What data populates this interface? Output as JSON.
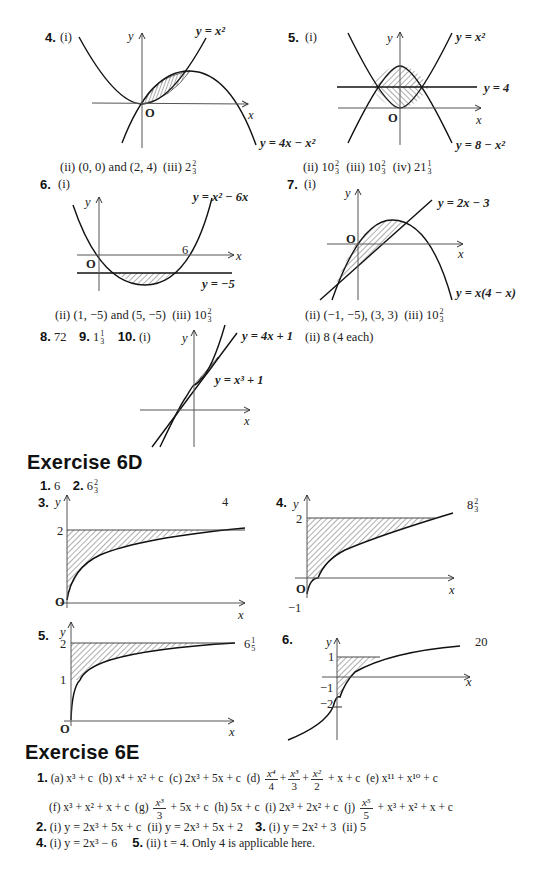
{
  "q4": {
    "num": "4.",
    "part_i": "(i)",
    "label_y": "y",
    "label_x": "x",
    "label_o": "O",
    "curve1": "y = x²",
    "curve2": "y = 4x − x²",
    "answer_ii": "(ii) (0, 0) and (2, 4)",
    "answer_iii_prefix": "(iii) 2",
    "answer_iii_num": "2",
    "answer_iii_den": "3"
  },
  "q5": {
    "num": "5.",
    "part_i": "(i)",
    "label_y": "y",
    "label_x": "x",
    "label_o": "O",
    "curve1": "y = x²",
    "line": "y = 4",
    "curve2": "y = 8 − x²",
    "answer_ii": "(ii) 10",
    "answer_ii_num": "2",
    "answer_ii_den": "3",
    "answer_iii": "(iii) 10",
    "answer_iii_num": "2",
    "answer_iii_den": "3",
    "answer_iv": "(iv) 21",
    "answer_iv_num": "1",
    "answer_iv_den": "3"
  },
  "q6": {
    "num": "6.",
    "part_i": "(i)",
    "label_y": "y",
    "label_x": "x",
    "label_o": "O",
    "label_6": "6",
    "curve": "y = x² − 6x",
    "line": "y = −5",
    "answer_ii": "(ii) (1, −5) and (5, −5)",
    "answer_iii": "(iii) 10",
    "answer_iii_num": "2",
    "answer_iii_den": "3"
  },
  "q7": {
    "num": "7.",
    "part_i": "(i)",
    "label_y": "y",
    "label_x": "x",
    "label_o": "O",
    "line": "y = 2x − 3",
    "curve": "y = x(4 − x)",
    "answer_ii": "(ii) (−1, −5), (3, 3)",
    "answer_iii": "(iii) 10",
    "answer_iii_num": "2",
    "answer_iii_den": "3"
  },
  "q8": {
    "num": "8.",
    "answer": "72"
  },
  "q9": {
    "num": "9.",
    "answer": "1",
    "answer_num": "1",
    "answer_den": "3"
  },
  "q10": {
    "num": "10.",
    "part_i": "(i)",
    "label_y": "y",
    "label_x": "x",
    "line": "y = 4x + 1",
    "curve": "y = x³ + 1",
    "answer_ii": "(ii) 8 (4 each)"
  },
  "ex6d": {
    "title": "Exercise 6D",
    "q1_num": "1.",
    "q1_answer": "6",
    "q2_num": "2.",
    "q2_answer": "6",
    "q2_num_frac": "2",
    "q2_den_frac": "3",
    "q3": {
      "num": "3.",
      "label_y": "y",
      "label_x": "x",
      "label_o": "O",
      "tick_2": "2",
      "answer": "4"
    },
    "q4": {
      "num": "4.",
      "label_y": "y",
      "label_x": "x",
      "label_o": "O",
      "tick_2": "2",
      "tick_m1": "−1",
      "answer": "8",
      "answer_num": "2",
      "answer_den": "3"
    },
    "q5": {
      "num": "5.",
      "label_y": "y",
      "label_x": "x",
      "label_o": "O",
      "tick_2": "2",
      "tick_1": "1",
      "answer": "6",
      "answer_num": "1",
      "answer_den": "5"
    },
    "q6": {
      "num": "6.",
      "label_y": "y",
      "label_x": "x",
      "tick_1": "1",
      "tick_m1": "−1",
      "tick_m2": "−2",
      "answer": "20"
    }
  },
  "ex6e": {
    "title": "Exercise 6E",
    "q1_num": "1.",
    "q1_line1": {
      "a": "(a) x³ + c",
      "b": "(b) x⁴ + x² + c",
      "c": "(c) 2x³ + 5x + c",
      "d_label": "(d)",
      "d_t1_top": "x⁴",
      "d_t1_bot": "4",
      "d_t2_top": "x³",
      "d_t2_bot": "3",
      "d_t3_top": "x²",
      "d_t3_bot": "2",
      "d_rest": "+ x + c",
      "e": "(e) x¹¹ + x¹⁰ + c"
    },
    "q1_line2": {
      "f": "(f) x³ + x² + x + c",
      "g_label": "(g)",
      "g_top": "x³",
      "g_bot": "3",
      "g_rest": "+ 5x + c",
      "h": "(h) 5x + c",
      "i": "(i) 2x³ + 2x² + c",
      "j_label": "(j)",
      "j_top": "x⁵",
      "j_bot": "5",
      "j_rest": "+ x³ + x² + x + c"
    },
    "q2_num": "2.",
    "q2_text": "(i) y = 2x³ + 5x + c  (ii) y = 2x³ + 5x + 2",
    "q3_num": "3.",
    "q3_text": "(i) y = 2x² + 3  (ii) 5",
    "q4_num": "4.",
    "q4_text": "(i) y = 2x³ − 6",
    "q5_num": "5.",
    "q5_text": "(ii) t = 4. Only 4 is applicable here."
  }
}
